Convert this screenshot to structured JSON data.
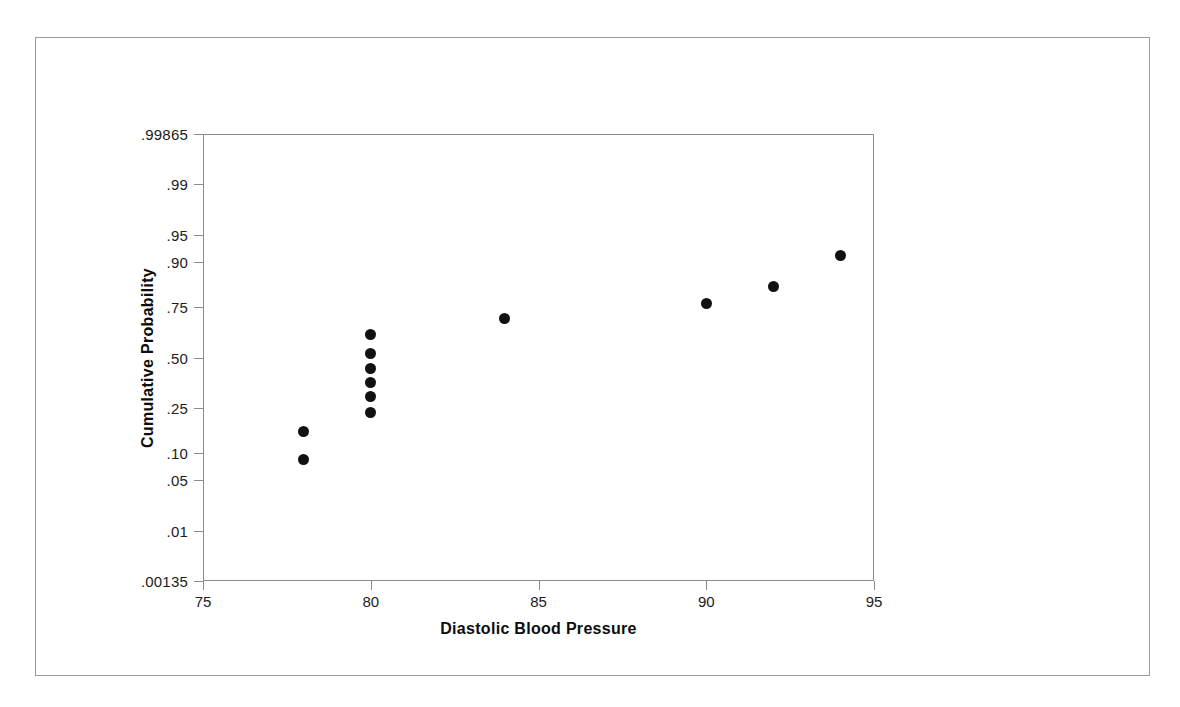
{
  "chart_data": {
    "type": "scatter",
    "title": "",
    "xlabel": "Diastolic Blood Pressure",
    "ylabel": "Cumulative Probability",
    "xlim": [
      75,
      95
    ],
    "ylim": [
      0.00135,
      0.99865
    ],
    "grid": false,
    "legend": null,
    "yscale": "normal-probability",
    "xticks": [
      "75",
      "80",
      "85",
      "90",
      "95"
    ],
    "xtick_values": [
      75,
      80,
      85,
      90,
      95
    ],
    "yticks": [
      ".00135",
      ".01",
      ".05",
      ".10",
      ".25",
      ".50",
      ".75",
      ".90",
      ".95",
      ".99",
      ".99865"
    ],
    "ytick_values": [
      0.00135,
      0.01,
      0.05,
      0.1,
      0.25,
      0.5,
      0.75,
      0.9,
      0.95,
      0.99,
      0.99865
    ],
    "series": [
      {
        "name": "Cumulative probability",
        "marker": "filled-circle",
        "color": "#111111",
        "points": [
          {
            "x": 78,
            "y": 0.16
          },
          {
            "x": 78,
            "y": 0.085
          },
          {
            "x": 80,
            "y": 0.62
          },
          {
            "x": 80,
            "y": 0.52
          },
          {
            "x": 80,
            "y": 0.44
          },
          {
            "x": 80,
            "y": 0.37
          },
          {
            "x": 80,
            "y": 0.3
          },
          {
            "x": 80,
            "y": 0.23
          },
          {
            "x": 84,
            "y": 0.7
          },
          {
            "x": 90,
            "y": 0.765
          },
          {
            "x": 92,
            "y": 0.83
          },
          {
            "x": 94,
            "y": 0.915
          }
        ]
      }
    ]
  },
  "colors": {
    "marker": "#111111",
    "axis": "#8c8c8c",
    "text": "#111111",
    "page_border": "#9a9a9a",
    "background": "#ffffff"
  }
}
